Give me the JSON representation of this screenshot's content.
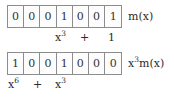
{
  "figure": {
    "type": "bit-array-polynomial-diagram",
    "rows": [
      {
        "id": "m-of-x",
        "bits": [
          "0",
          "0",
          "0",
          "1",
          "0",
          "0",
          "1"
        ],
        "label_text": "m(x)",
        "label_base": "m(x)",
        "label_prefix": "",
        "label_prefix_exp": "",
        "polynomial_text": "x^3 + 1",
        "terms": [
          {
            "base": "x",
            "exponent": "3",
            "left_px": 55
          },
          {
            "base": "+",
            "exponent": "",
            "left_px": 80
          },
          {
            "base": "1",
            "exponent": "",
            "left_px": 108
          }
        ]
      },
      {
        "id": "x3-m-of-x",
        "bits": [
          "1",
          "0",
          "0",
          "1",
          "0",
          "0",
          "0"
        ],
        "label_text": "x^3 m(x)",
        "label_base": "m(x)",
        "label_prefix": "x",
        "label_prefix_exp": "3",
        "polynomial_text": "x^6 + x^3",
        "terms": [
          {
            "base": "x",
            "exponent": "6",
            "left_px": 8
          },
          {
            "base": "+",
            "exponent": "",
            "left_px": 33
          },
          {
            "base": "x",
            "exponent": "3",
            "left_px": 55
          }
        ]
      }
    ],
    "colors": {
      "background": "#ffffff",
      "cell_border": "#8c8c8c",
      "text": "#2b2b2b"
    }
  }
}
